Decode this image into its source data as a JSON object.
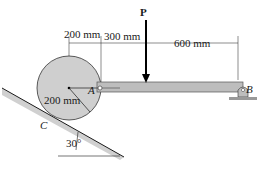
{
  "diagram": {
    "load_label": "P",
    "dim_left": "200 mm",
    "dim_mid": "300 mm",
    "dim_right": "600 mm",
    "radius_label": "200 mm",
    "point_a": "A",
    "point_b": "B",
    "point_c": "C",
    "angle_label": "30°"
  },
  "colors": {
    "disk_fill": "#cfcfcf",
    "beam_fill": "#b8b8b8",
    "incline_shade": "#c8c8c8",
    "line": "#1a1a1a"
  }
}
